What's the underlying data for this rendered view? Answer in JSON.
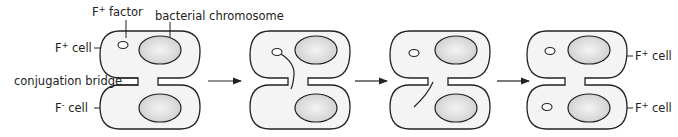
{
  "diagram": {
    "type": "bacterial conjugation sequence",
    "labels": {
      "f_factor": "F+ factor",
      "f_factor_base": "F",
      "f_factor_sup": "+",
      "f_factor_rest": " factor",
      "chromosome": "bacterial chromosome",
      "donor_cell_base": "F",
      "donor_cell_sup": "+",
      "donor_cell_rest": " cell",
      "bridge": "conjugation bridge",
      "recipient_cell_base": "F",
      "recipient_cell_sup": "-",
      "recipient_cell_rest": " cell",
      "result_top_base": "F",
      "result_top_sup": "+",
      "result_top_rest": " cell",
      "result_bottom_base": "F",
      "result_bottom_sup": "+",
      "result_bottom_rest": " cell"
    },
    "stages": [
      {
        "id": 1,
        "description": "F+ cell connected to F- cell by conjugation bridge"
      },
      {
        "id": 2,
        "description": "F factor strand transferring through bridge"
      },
      {
        "id": 3,
        "description": "F factor strand entering recipient"
      },
      {
        "id": 4,
        "description": "Both cells become F+"
      }
    ],
    "colors": {
      "outline": "#222222",
      "cell_fill": "#f4f4f4",
      "chromosome_fill": "#d6d6d6",
      "chromosome_highlight": "#f2f2f2"
    }
  }
}
